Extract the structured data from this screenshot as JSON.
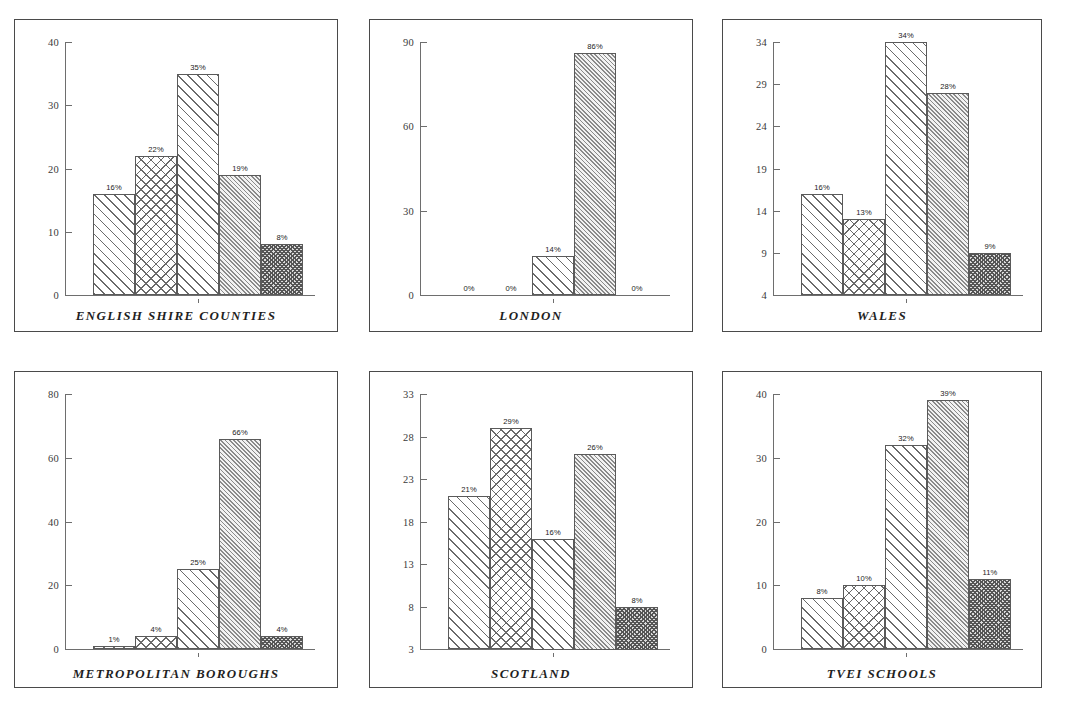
{
  "figure": {
    "layout": "2 rows x 3 columns of bar-chart panels",
    "panels_order": [
      "english-shire-counties",
      "london",
      "wales",
      "metropolitan-boroughs",
      "scotland",
      "tvei-schools"
    ]
  },
  "chart_data": [
    {
      "type": "bar",
      "title": "ENGLISH SHIRE COUNTIES",
      "categories": [
        "1",
        "2",
        "3",
        "4",
        "5"
      ],
      "values": [
        16,
        22,
        35,
        19,
        8
      ],
      "data_labels": [
        "16%",
        "22%",
        "35%",
        "19%",
        "8%"
      ],
      "xlabel": "",
      "ylabel": "",
      "ylim": [
        0,
        40
      ],
      "yticks": [
        0,
        10,
        20,
        30,
        40
      ],
      "ytick_labels": [
        "0",
        "10",
        "20",
        "30",
        "40"
      ],
      "grid": false,
      "legend": "none"
    },
    {
      "type": "bar",
      "title": "LONDON",
      "categories": [
        "1",
        "2",
        "3",
        "4",
        "5"
      ],
      "values": [
        0,
        0,
        14,
        86,
        0
      ],
      "data_labels": [
        "0%",
        "0%",
        "14%",
        "86%",
        "0%"
      ],
      "xlabel": "",
      "ylabel": "",
      "ylim": [
        0,
        90
      ],
      "yticks": [
        0,
        30,
        60,
        90
      ],
      "ytick_labels": [
        "0",
        "30",
        "60",
        "90"
      ],
      "grid": false,
      "legend": "none"
    },
    {
      "type": "bar",
      "title": "WALES",
      "categories": [
        "1",
        "2",
        "3",
        "4",
        "5"
      ],
      "values": [
        16,
        13,
        34,
        28,
        9
      ],
      "data_labels": [
        "16%",
        "13%",
        "34%",
        "28%",
        "9%"
      ],
      "xlabel": "",
      "ylabel": "",
      "ylim": [
        4,
        34
      ],
      "yticks": [
        4,
        9,
        14,
        19,
        24,
        29,
        34
      ],
      "ytick_labels": [
        "4",
        "9",
        "14",
        "19",
        "24",
        "29",
        "34"
      ],
      "grid": false,
      "legend": "none"
    },
    {
      "type": "bar",
      "title": "METROPOLITAN BOROUGHS",
      "categories": [
        "1",
        "2",
        "3",
        "4",
        "5"
      ],
      "values": [
        1,
        4,
        25,
        66,
        4
      ],
      "data_labels": [
        "1%",
        "4%",
        "25%",
        "66%",
        "4%"
      ],
      "xlabel": "",
      "ylabel": "",
      "ylim": [
        0,
        80
      ],
      "yticks": [
        0,
        20,
        40,
        60,
        80
      ],
      "ytick_labels": [
        "0",
        "20",
        "40",
        "60",
        "80"
      ],
      "grid": false,
      "legend": "none"
    },
    {
      "type": "bar",
      "title": "SCOTLAND",
      "categories": [
        "1",
        "2",
        "3",
        "4",
        "5"
      ],
      "values": [
        21,
        29,
        16,
        26,
        8
      ],
      "data_labels": [
        "21%",
        "29%",
        "16%",
        "26%",
        "8%"
      ],
      "xlabel": "",
      "ylabel": "",
      "ylim": [
        3,
        33
      ],
      "yticks": [
        3,
        8,
        13,
        18,
        23,
        28,
        33
      ],
      "ytick_labels": [
        "3",
        "8",
        "13",
        "18",
        "23",
        "28",
        "33"
      ],
      "grid": false,
      "legend": "none"
    },
    {
      "type": "bar",
      "title": "TVEI SCHOOLS",
      "categories": [
        "1",
        "2",
        "3",
        "4",
        "5"
      ],
      "values": [
        8,
        10,
        32,
        39,
        11
      ],
      "data_labels": [
        "8%",
        "10%",
        "32%",
        "39%",
        "11%"
      ],
      "xlabel": "",
      "ylabel": "",
      "ylim": [
        0,
        40
      ],
      "yticks": [
        0,
        10,
        20,
        30,
        40
      ],
      "ytick_labels": [
        "0",
        "10",
        "20",
        "30",
        "40"
      ],
      "grid": false,
      "legend": "none"
    }
  ],
  "colors": {
    "panel_border": "#4a4a4a",
    "axis": "#6e6e6e",
    "bar_outline": "#5a5a5a",
    "hatch": "#6a6a6a",
    "hatch_dark": "#555555",
    "text": "#1f1f1f",
    "background": "#ffffff"
  }
}
